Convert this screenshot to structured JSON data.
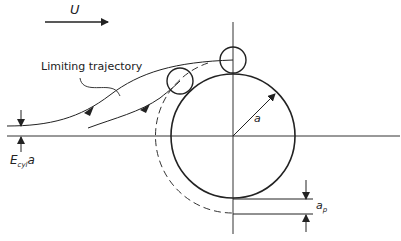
{
  "diagram": {
    "flow_label": "U",
    "limiting_trajectory_label": "Limiting trajectory",
    "radius_label": "a",
    "capture_width_label": "E",
    "capture_width_sub": "cyl",
    "capture_width_suffix": "a",
    "particle_radius_label": "a",
    "particle_radius_sub": "p",
    "colors": {
      "stroke": "#222222",
      "background": "#ffffff"
    }
  }
}
